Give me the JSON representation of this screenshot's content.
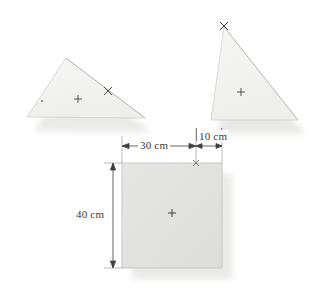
{
  "figure": {
    "background_color": "#ffffff",
    "shape_fill_light": "#f3f3f1",
    "shape_fill_medium": "#e2e2e0",
    "shape_stroke": "#c9c9c6",
    "shadow_color": "#e8e8e6",
    "mark_color": "#3a3a3a",
    "dimension_color": "#3f3f3f"
  },
  "dimensions": {
    "width_left": "30 cm",
    "width_right": "10 cm",
    "height": "40 cm"
  },
  "shapes": {
    "left_triangle": {
      "name": "left-triangle",
      "points": "66,58 145,118 27,117",
      "centroid_mark": "+",
      "vertex_mark": "×",
      "small_dot": "·"
    },
    "right_triangle": {
      "name": "right-triangle",
      "points": "224,27 298,120 211,120",
      "centroid_mark": "+",
      "vertex_mark": "×"
    },
    "rectangle": {
      "name": "rectangle",
      "x": 122,
      "y": 163,
      "width": 100,
      "height": 105,
      "centroid_mark": "+",
      "corner_mark": "×"
    }
  },
  "marks": {
    "plus": "+",
    "cross": "×",
    "dot": "·"
  }
}
